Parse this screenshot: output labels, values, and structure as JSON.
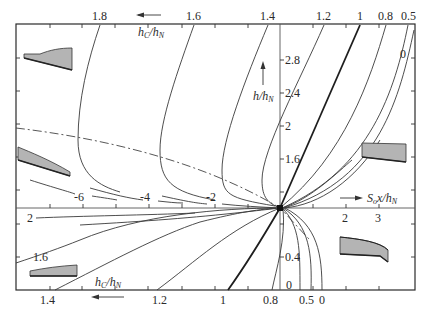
{
  "diagram": {
    "title": "",
    "top_axis": {
      "label_main": "h",
      "label_sub": "C",
      "label_sep": "/",
      "label_main2": "h",
      "label_sub2": "N",
      "direction": "left-arrow",
      "labels": [
        "1.8",
        "1.6",
        "1.4",
        "1.2",
        "1",
        "0.8",
        "0.5"
      ]
    },
    "bottom_axis": {
      "label_main": "h",
      "label_sub": "C",
      "label_sep": "/",
      "label_main2": "h",
      "label_sub2": "N",
      "direction": "left-arrow",
      "labels": [
        "1.4",
        "1.2",
        "1",
        "0.8",
        "0.5",
        "0"
      ]
    },
    "vertical_axis": {
      "label_main": "h",
      "label_sep": "/",
      "label_main2": "h",
      "label_sub2": "N",
      "direction": "up-arrow",
      "ticks": [
        "2.8",
        "2.4",
        "2",
        "1.6",
        "0.4",
        "0"
      ]
    },
    "horizontal_axis": {
      "label_main": "S",
      "label_sub": "o",
      "label_rest": "x/",
      "label_main2": "h",
      "label_sub2": "N",
      "direction": "right-arrow",
      "positive_ticks": [
        "2",
        "3"
      ],
      "negative_ticks": [
        "-6",
        "-4",
        "-2"
      ],
      "left_mark": "2"
    },
    "curve_labels": {
      "right_zero": "0",
      "left_16": "1.6"
    },
    "sketches": [
      {
        "name": "top-left-profile",
        "position": "upper-left"
      },
      {
        "name": "mid-left-profile",
        "position": "middle-left"
      },
      {
        "name": "bottom-left-profile",
        "position": "lower-left"
      },
      {
        "name": "upper-right-profile",
        "position": "upper-right"
      },
      {
        "name": "lower-right-profile",
        "position": "lower-right"
      }
    ],
    "colors": {
      "line": "#3a3a3a",
      "bold_line": "#1e1e1e",
      "sketch_fill": "#b4b4b4",
      "background": "#ffffff"
    }
  }
}
